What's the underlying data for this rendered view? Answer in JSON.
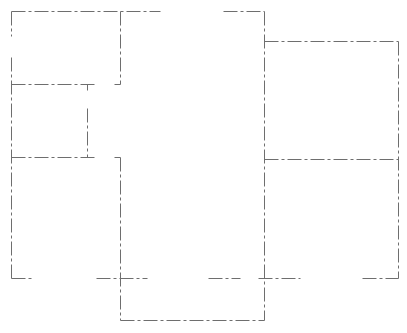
{
  "diagram": {
    "type": "floor-plan",
    "background": "#ffffff",
    "line_color": "#6e6e6e",
    "line_width": 1,
    "dash_pattern": "14 3 3 3",
    "walls": [
      {
        "id": "top-left-room-top",
        "x1": 11,
        "y1": 11,
        "x2": 160,
        "y2": 11
      },
      {
        "id": "top-left-room-left-upper",
        "x1": 11,
        "y1": 11,
        "x2": 11,
        "y2": 36
      },
      {
        "id": "left-outer-wall",
        "x1": 11,
        "y1": 57,
        "x2": 11,
        "y2": 278
      },
      {
        "id": "top-left-room-right",
        "x1": 120,
        "y1": 11,
        "x2": 120,
        "y2": 84
      },
      {
        "id": "top-left-room-right-stub",
        "x1": 114,
        "y1": 84,
        "x2": 120,
        "y2": 84
      },
      {
        "id": "closet-top",
        "x1": 11,
        "y1": 84,
        "x2": 94,
        "y2": 84
      },
      {
        "id": "closet-right-stub",
        "x1": 87,
        "y1": 84,
        "x2": 87,
        "y2": 90
      },
      {
        "id": "closet-right",
        "x1": 87,
        "y1": 108,
        "x2": 87,
        "y2": 157
      },
      {
        "id": "closet-bottom",
        "x1": 11,
        "y1": 157,
        "x2": 94,
        "y2": 157
      },
      {
        "id": "lower-center-stub",
        "x1": 114,
        "y1": 157,
        "x2": 120,
        "y2": 157
      },
      {
        "id": "lower-center-wall",
        "x1": 120,
        "y1": 157,
        "x2": 120,
        "y2": 320
      },
      {
        "id": "top-right-segment",
        "x1": 223,
        "y1": 11,
        "x2": 264,
        "y2": 11
      },
      {
        "id": "right-divider-wall",
        "x1": 264,
        "y1": 11,
        "x2": 264,
        "y2": 320
      },
      {
        "id": "right-room-top",
        "x1": 264,
        "y1": 41,
        "x2": 398,
        "y2": 41
      },
      {
        "id": "right-outer-wall",
        "x1": 398,
        "y1": 41,
        "x2": 398,
        "y2": 278
      },
      {
        "id": "right-room-divider",
        "x1": 264,
        "y1": 159,
        "x2": 398,
        "y2": 159
      },
      {
        "id": "bottom-left-segment",
        "x1": 11,
        "y1": 278,
        "x2": 33,
        "y2": 278
      },
      {
        "id": "bottom-center-segment",
        "x1": 96,
        "y1": 278,
        "x2": 147,
        "y2": 278
      },
      {
        "id": "bottom-mid-segment",
        "x1": 208,
        "y1": 278,
        "x2": 240,
        "y2": 278
      },
      {
        "id": "bottom-right-center-segment",
        "x1": 258,
        "y1": 278,
        "x2": 300,
        "y2": 278
      },
      {
        "id": "bottom-right-segment",
        "x1": 362,
        "y1": 278,
        "x2": 398,
        "y2": 278
      },
      {
        "id": "annex-bottom",
        "x1": 120,
        "y1": 320,
        "x2": 264,
        "y2": 320
      }
    ]
  }
}
